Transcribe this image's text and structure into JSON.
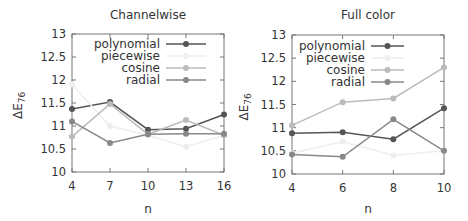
{
  "colors": {
    "polynomial": "#555555",
    "piecewise": "#eeeeee",
    "cosine": "#bbbbbb",
    "radial": "#888888",
    "axis": "#777777"
  },
  "chart_data": [
    {
      "type": "line",
      "title": "Channelwise",
      "xlabel": "n",
      "ylabel": "ΔE76",
      "x": [
        4,
        7,
        10,
        13,
        16
      ],
      "xticks": [
        "4",
        "7",
        "10",
        "13",
        "16"
      ],
      "yticks": [
        "10",
        "10.5",
        "11",
        "11.5",
        "12",
        "12.5",
        "13"
      ],
      "ylim": [
        10,
        13
      ],
      "grid": false,
      "legend_position": "upper right",
      "series": [
        {
          "name": "polynomial",
          "values": [
            11.37,
            11.52,
            10.92,
            10.94,
            11.25
          ]
        },
        {
          "name": "piecewise",
          "values": [
            11.9,
            11.0,
            10.8,
            10.55,
            10.8
          ]
        },
        {
          "name": "cosine",
          "values": [
            10.77,
            11.48,
            10.82,
            11.13,
            10.8
          ]
        },
        {
          "name": "radial",
          "values": [
            11.1,
            10.63,
            10.82,
            10.83,
            10.83
          ]
        }
      ]
    },
    {
      "type": "line",
      "title": "Full color",
      "xlabel": "n",
      "ylabel": "ΔE76",
      "x": [
        4,
        6,
        8,
        10
      ],
      "xticks": [
        "4",
        "6",
        "8",
        "10"
      ],
      "yticks": [
        "10",
        "10.5",
        "11",
        "11.5",
        "12",
        "12.5",
        "13"
      ],
      "ylim": [
        10,
        13
      ],
      "grid": false,
      "legend_position": "upper left",
      "series": [
        {
          "name": "polynomial",
          "values": [
            10.88,
            10.9,
            10.75,
            11.42
          ]
        },
        {
          "name": "piecewise",
          "values": [
            10.45,
            10.7,
            10.4,
            10.5
          ]
        },
        {
          "name": "cosine",
          "values": [
            11.05,
            11.55,
            11.63,
            12.3
          ]
        },
        {
          "name": "radial",
          "values": [
            10.42,
            10.37,
            11.18,
            10.5
          ]
        }
      ]
    }
  ]
}
